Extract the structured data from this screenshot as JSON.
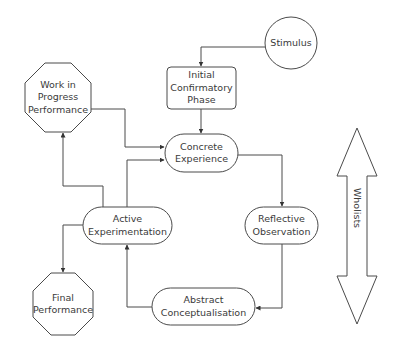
{
  "diagram": {
    "type": "learning-cycle-flowchart",
    "colors": {
      "stroke": "#4a4a4a",
      "arrowhead": "#333333",
      "text": "#3a3a3a",
      "background": "#ffffff"
    },
    "nodes": {
      "stimulus": {
        "label": "Stimulus",
        "shape": "circle"
      },
      "initial_confirmatory_phase": {
        "line1": "Initial",
        "line2": "Confirmatory",
        "line3": "Phase",
        "shape": "rounded-rectangle"
      },
      "concrete_experience": {
        "line1": "Concrete",
        "line2": "Experience",
        "shape": "pill"
      },
      "reflective_observation": {
        "line1": "Reflective",
        "line2": "Observation",
        "shape": "pill"
      },
      "abstract_conceptualisation": {
        "line1": "Abstract",
        "line2": "Conceptualisation",
        "shape": "pill"
      },
      "active_experimentation": {
        "line1": "Active",
        "line2": "Experimentation",
        "shape": "pill"
      },
      "work_in_progress_performance": {
        "line1": "Work in",
        "line2": "Progress",
        "line3": "Performance",
        "shape": "octagon"
      },
      "final_performance": {
        "line1": "Final",
        "line2": "Performance",
        "shape": "octagon"
      }
    },
    "edges": [
      {
        "from": "Stimulus",
        "to": "Initial Confirmatory Phase"
      },
      {
        "from": "Initial Confirmatory Phase",
        "to": "Concrete Experience"
      },
      {
        "from": "Concrete Experience",
        "to": "Reflective Observation"
      },
      {
        "from": "Reflective Observation",
        "to": "Abstract Conceptualisation"
      },
      {
        "from": "Abstract Conceptualisation",
        "to": "Active Experimentation"
      },
      {
        "from": "Active Experimentation",
        "to": "Concrete Experience"
      },
      {
        "from": "Active Experimentation",
        "to": "Work in Progress Performance"
      },
      {
        "from": "Work in Progress Performance",
        "to": "Concrete Experience"
      },
      {
        "from": "Active Experimentation",
        "to": "Final Performance"
      }
    ],
    "side_arrow": {
      "label": "Wholists",
      "shape": "double-headed-vertical-arrow"
    }
  }
}
